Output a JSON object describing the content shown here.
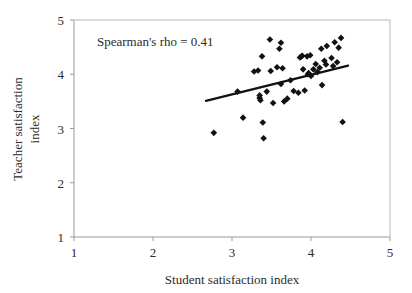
{
  "chart_data": {
    "type": "scatter",
    "title": "",
    "xlabel": "Student satisfaction index",
    "ylabel": "Teacher satisfaction index",
    "ylabel_line1": "Teacher satisfaction",
    "ylabel_line2": "index",
    "xlim": [
      1,
      5
    ],
    "ylim": [
      1,
      5
    ],
    "xticks": [
      1,
      2,
      3,
      4,
      5
    ],
    "yticks": [
      1,
      2,
      3,
      4,
      5
    ],
    "xtick_labels": [
      "1",
      "2",
      "3",
      "4",
      "5"
    ],
    "ytick_labels": [
      "1",
      "2",
      "3",
      "4",
      "5"
    ],
    "grid": false,
    "legend": false,
    "marker": "diamond",
    "marker_color": "#111111",
    "annotations": [
      {
        "text": "Spearman's rho = 0.41",
        "x": 2.3,
        "y": 4.62
      }
    ],
    "statistics": {
      "spearman_rho": 0.41
    },
    "trendline": {
      "visible": true,
      "color": "#111111",
      "x_start": 2.67,
      "y_start": 3.51,
      "x_end": 4.47,
      "y_end": 4.16
    },
    "points": [
      {
        "x": 2.77,
        "y": 2.92
      },
      {
        "x": 3.07,
        "y": 3.68
      },
      {
        "x": 3.14,
        "y": 3.2
      },
      {
        "x": 3.28,
        "y": 4.05
      },
      {
        "x": 3.33,
        "y": 4.07
      },
      {
        "x": 3.35,
        "y": 3.56
      },
      {
        "x": 3.35,
        "y": 3.61
      },
      {
        "x": 3.36,
        "y": 3.52
      },
      {
        "x": 3.38,
        "y": 4.33
      },
      {
        "x": 3.39,
        "y": 3.11
      },
      {
        "x": 3.4,
        "y": 2.82
      },
      {
        "x": 3.44,
        "y": 3.68
      },
      {
        "x": 3.48,
        "y": 4.64
      },
      {
        "x": 3.49,
        "y": 4.06
      },
      {
        "x": 3.52,
        "y": 3.47
      },
      {
        "x": 3.57,
        "y": 4.13
      },
      {
        "x": 3.6,
        "y": 4.47
      },
      {
        "x": 3.62,
        "y": 4.58
      },
      {
        "x": 3.62,
        "y": 3.82
      },
      {
        "x": 3.64,
        "y": 4.11
      },
      {
        "x": 3.66,
        "y": 3.5
      },
      {
        "x": 3.7,
        "y": 3.55
      },
      {
        "x": 3.74,
        "y": 3.89
      },
      {
        "x": 3.78,
        "y": 3.69
      },
      {
        "x": 3.84,
        "y": 3.66
      },
      {
        "x": 3.86,
        "y": 4.31
      },
      {
        "x": 3.88,
        "y": 4.33
      },
      {
        "x": 3.89,
        "y": 4.34
      },
      {
        "x": 3.9,
        "y": 4.09
      },
      {
        "x": 3.92,
        "y": 3.7
      },
      {
        "x": 3.95,
        "y": 4.33
      },
      {
        "x": 3.96,
        "y": 4.0
      },
      {
        "x": 3.97,
        "y": 4.02
      },
      {
        "x": 3.99,
        "y": 4.35
      },
      {
        "x": 4.0,
        "y": 3.97
      },
      {
        "x": 4.03,
        "y": 4.09
      },
      {
        "x": 4.06,
        "y": 4.19
      },
      {
        "x": 4.08,
        "y": 4.04
      },
      {
        "x": 4.11,
        "y": 4.12
      },
      {
        "x": 4.13,
        "y": 4.47
      },
      {
        "x": 4.14,
        "y": 3.8
      },
      {
        "x": 4.17,
        "y": 4.25
      },
      {
        "x": 4.19,
        "y": 4.18
      },
      {
        "x": 4.2,
        "y": 4.52
      },
      {
        "x": 4.26,
        "y": 4.3
      },
      {
        "x": 4.28,
        "y": 4.15
      },
      {
        "x": 4.3,
        "y": 4.59
      },
      {
        "x": 4.33,
        "y": 4.22
      },
      {
        "x": 4.35,
        "y": 4.49
      },
      {
        "x": 4.38,
        "y": 4.67
      },
      {
        "x": 4.4,
        "y": 3.12
      }
    ]
  }
}
